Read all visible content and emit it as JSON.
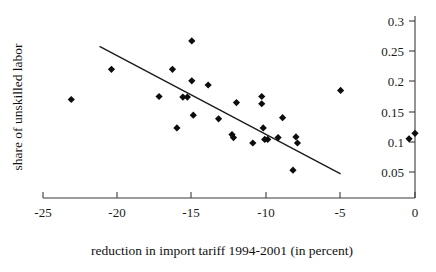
{
  "chart_data": {
    "type": "scatter",
    "title": "",
    "xlabel": "reduction in import tariff 1994-2001 (in percent)",
    "ylabel": "share of unskilled labor",
    "xlim": [
      -25,
      0
    ],
    "ylim": [
      0.05,
      0.3
    ],
    "grid": false,
    "legend": null,
    "xticks": [
      "-25",
      "-20",
      "-15",
      "-10",
      "-5",
      "0"
    ],
    "xtick_values": [
      -25,
      -20,
      -15,
      -10,
      -5,
      0
    ],
    "yticks": [
      "0.3",
      "0.25",
      "0.2",
      "0.15",
      "0.1",
      "0.05"
    ],
    "ytick_values": [
      0.3,
      0.25,
      0.2,
      0.15,
      0.1,
      0.05
    ],
    "y_axis_position": "right",
    "x_axis_position": "bottom",
    "marker": "diamond",
    "marker_color": "#0d0d0d",
    "points": [
      {
        "x": -23.1,
        "y": 0.17
      },
      {
        "x": -20.4,
        "y": 0.22
      },
      {
        "x": -17.2,
        "y": 0.175
      },
      {
        "x": -16.3,
        "y": 0.22
      },
      {
        "x": -16.0,
        "y": 0.123
      },
      {
        "x": -15.6,
        "y": 0.174
      },
      {
        "x": -15.3,
        "y": 0.174
      },
      {
        "x": -15.0,
        "y": 0.267
      },
      {
        "x": -15.0,
        "y": 0.201
      },
      {
        "x": -14.9,
        "y": 0.144
      },
      {
        "x": -13.9,
        "y": 0.194
      },
      {
        "x": -13.2,
        "y": 0.138
      },
      {
        "x": -12.3,
        "y": 0.112
      },
      {
        "x": -12.2,
        "y": 0.107
      },
      {
        "x": -12.0,
        "y": 0.165
      },
      {
        "x": -10.9,
        "y": 0.098
      },
      {
        "x": -10.3,
        "y": 0.175
      },
      {
        "x": -10.3,
        "y": 0.163
      },
      {
        "x": -10.2,
        "y": 0.123
      },
      {
        "x": -10.1,
        "y": 0.104
      },
      {
        "x": -9.9,
        "y": 0.104
      },
      {
        "x": -9.2,
        "y": 0.107
      },
      {
        "x": -8.9,
        "y": 0.14
      },
      {
        "x": -8.2,
        "y": 0.053
      },
      {
        "x": -8.0,
        "y": 0.108
      },
      {
        "x": -7.9,
        "y": 0.098
      },
      {
        "x": -5.0,
        "y": 0.185
      },
      {
        "x": -0.4,
        "y": 0.105
      },
      {
        "x": 0.0,
        "y": 0.114
      }
    ],
    "trendline": {
      "type": "linear",
      "x_start": -21.2,
      "y_start": 0.258,
      "x_end": -5.0,
      "y_end": 0.047
    }
  }
}
